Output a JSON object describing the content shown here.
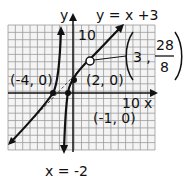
{
  "chart_data": {
    "type": "line",
    "title": "",
    "xlabel": "x",
    "ylabel": "y",
    "x_tick_label": "10",
    "y_tick_label": "10",
    "grid": true,
    "series": [
      {
        "name": "rational function graph",
        "asymptote_vertical": "x = -2",
        "x_intercepts": [
          "(-4, 0)",
          "(2, 0)"
        ]
      },
      {
        "name": "oblique asymptote",
        "equation": "y = x +3"
      }
    ],
    "annotations": [
      {
        "text": "y = x +3"
      },
      {
        "text": "(-4, 0)"
      },
      {
        "text": "(2, 0)"
      },
      {
        "text": "(-1, 0)"
      },
      {
        "text": "x = -2"
      },
      {
        "text": "(3 , 28/8)",
        "hole": true
      }
    ]
  },
  "labels": {
    "y_axis": "y",
    "x_axis": "x",
    "y_ten": "10",
    "x_ten": "10",
    "oblique": "y = x +3",
    "pt_neg4": "(-4, 0)",
    "pt_2": "(2, 0)",
    "pt_neg1": "(-1, 0)",
    "vert_asym": "x = -2",
    "hole_x": "3 ,",
    "hole_num": "28",
    "hole_den": "8"
  }
}
